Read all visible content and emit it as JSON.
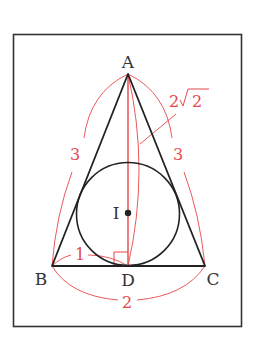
{
  "diagram": {
    "title": "",
    "colors": {
      "frame": "#333333",
      "triangle": "#222222",
      "annotation": "#e8474a"
    },
    "points": {
      "A": {
        "label": "A",
        "x": 128,
        "y": 74
      },
      "B": {
        "label": "B",
        "x": 52,
        "y": 266
      },
      "C": {
        "label": "C",
        "x": 205,
        "y": 266
      },
      "D": {
        "label": "D",
        "x": 128,
        "y": 266
      },
      "I": {
        "label": "I",
        "x": 128,
        "y": 213
      }
    },
    "incircle": {
      "center": "I",
      "radius": 51
    },
    "measurements": {
      "AB": "3",
      "AC": "3",
      "AD_prefix": "2",
      "AD_radicand": "2",
      "BD": "1",
      "BC": "2"
    },
    "marks": {
      "right_angle_at": "D"
    }
  }
}
